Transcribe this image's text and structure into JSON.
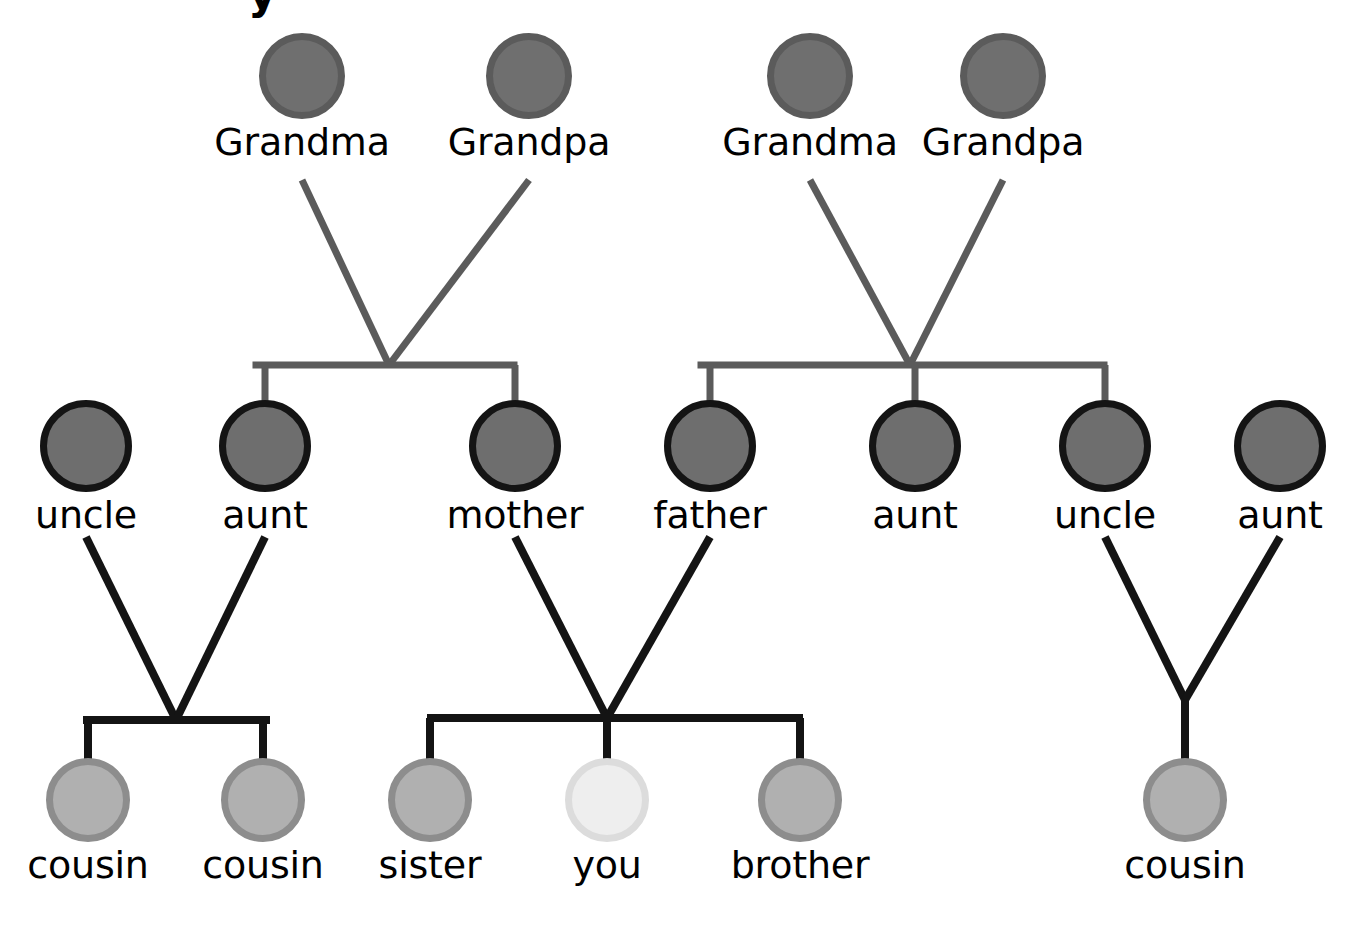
{
  "diagram": {
    "kind": "family-tree",
    "title_fragment": "y",
    "background_color": "#ffffff",
    "generations": [
      {
        "id": "grandparents",
        "label": "grandparents",
        "circle_diameter": 86,
        "circle_fill": "#6f6f6f",
        "circle_stroke": "#5b5b5b",
        "edge_color": "#5b5b5b",
        "edge_width": 7,
        "nodes": [
          {
            "id": "g1",
            "label": "Grandma",
            "cx": 302,
            "cy": 76
          },
          {
            "id": "g2",
            "label": "Grandpa",
            "cx": 529,
            "cy": 76
          },
          {
            "id": "g3",
            "label": "Grandma",
            "cx": 810,
            "cy": 76
          },
          {
            "id": "g4",
            "label": "Grandpa",
            "cx": 1003,
            "cy": 76
          }
        ]
      },
      {
        "id": "parents",
        "label": "parents",
        "circle_diameter": 92,
        "circle_fill": "#6e6e6e",
        "circle_stroke": "#141414",
        "edge_color": "#141414",
        "edge_width": 8,
        "nodes": [
          {
            "id": "p1",
            "label": "uncle",
            "cx": 86,
            "cy": 446
          },
          {
            "id": "p2",
            "label": "aunt",
            "cx": 265,
            "cy": 446
          },
          {
            "id": "p3",
            "label": "mother",
            "cx": 515,
            "cy": 446
          },
          {
            "id": "p4",
            "label": "father",
            "cx": 710,
            "cy": 446
          },
          {
            "id": "p5",
            "label": "aunt",
            "cx": 915,
            "cy": 446
          },
          {
            "id": "p6",
            "label": "uncle",
            "cx": 1105,
            "cy": 446
          },
          {
            "id": "p7",
            "label": "aunt",
            "cx": 1280,
            "cy": 446
          }
        ]
      },
      {
        "id": "children",
        "label": "children",
        "circle_diameter": 84,
        "circle_fill": "#b0b0b0",
        "circle_stroke": "#8d8d8d",
        "self_fill": "#eeeeee",
        "self_stroke": "#dcdcdc",
        "edge_color": "#141414",
        "edge_width": 8,
        "nodes": [
          {
            "id": "c1",
            "label": "cousin",
            "cx": 88,
            "cy": 800,
            "is_self": false
          },
          {
            "id": "c2",
            "label": "cousin",
            "cx": 263,
            "cy": 800,
            "is_self": false
          },
          {
            "id": "c3",
            "label": "sister",
            "cx": 430,
            "cy": 800,
            "is_self": false
          },
          {
            "id": "c4",
            "label": "you",
            "cx": 607,
            "cy": 800,
            "is_self": true
          },
          {
            "id": "c5",
            "label": "brother",
            "cx": 800,
            "cy": 800,
            "is_self": false
          },
          {
            "id": "c6",
            "label": "cousin",
            "cx": 1185,
            "cy": 800,
            "is_self": false
          }
        ]
      }
    ],
    "unions": [
      {
        "id": "maternal-grandparents",
        "partners": [
          "g1",
          "g2"
        ],
        "apex_x": 389,
        "apex_y": 365,
        "partner_stem_y": 180,
        "bar_y": 365,
        "bar_left": 256,
        "bar_right": 514,
        "drop_y": 404,
        "children": [
          "p2",
          "p3"
        ],
        "color": "#5b5b5b",
        "width": 7
      },
      {
        "id": "paternal-grandparents",
        "partners": [
          "g3",
          "g4"
        ],
        "apex_x": 910,
        "apex_y": 365,
        "partner_stem_y": 180,
        "bar_y": 365,
        "bar_left": 701,
        "bar_right": 1104,
        "drop_y": 404,
        "children": [
          "p4",
          "p5",
          "p6"
        ],
        "color": "#5b5b5b",
        "width": 7
      },
      {
        "id": "uncle-aunt-left",
        "partners": [
          "p1",
          "p2"
        ],
        "apex_x": 176,
        "apex_y": 720,
        "partner_stem_y": 537,
        "bar_y": 720,
        "bar_left": 87,
        "bar_right": 266,
        "drop_y": 760,
        "children": [
          "c1",
          "c2"
        ],
        "color": "#141414",
        "width": 8
      },
      {
        "id": "mother-father",
        "partners": [
          "p3",
          "p4"
        ],
        "apex_x": 607,
        "apex_y": 718,
        "partner_stem_y": 537,
        "bar_y": 718,
        "bar_left": 431,
        "bar_right": 799,
        "drop_y": 760,
        "children": [
          "c3",
          "c4",
          "c5"
        ],
        "color": "#141414",
        "width": 8
      },
      {
        "id": "uncle-aunt-right",
        "partners": [
          "p6",
          "p7"
        ],
        "apex_x": 1185,
        "apex_y": 700,
        "partner_stem_y": 537,
        "bar_y": 700,
        "bar_left": 1185,
        "bar_right": 1185,
        "drop_y": 760,
        "children": [
          "c6"
        ],
        "color": "#141414",
        "width": 8
      }
    ]
  }
}
